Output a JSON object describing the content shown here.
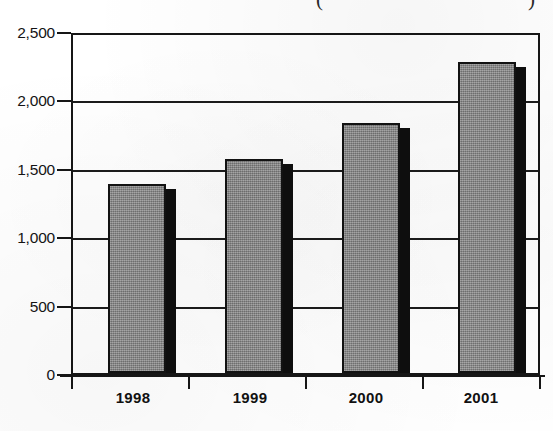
{
  "chart_data": {
    "type": "bar",
    "title": "",
    "title_fragment_left": "(",
    "title_fragment_right": ")",
    "xlabel": "",
    "ylabel": "",
    "categories": [
      "1998",
      "1999",
      "2000",
      "2001"
    ],
    "values": [
      1400,
      1580,
      1850,
      2300
    ],
    "series": [
      {
        "name": "",
        "values": [
          1400,
          1580,
          1850,
          2300
        ]
      }
    ],
    "ylim": [
      0,
      2500
    ],
    "y_ticks": [
      0,
      500,
      1000,
      1500,
      2000,
      2500
    ],
    "y_tick_labels": [
      "0",
      "500",
      "1,000",
      "1,500",
      "2,000",
      "2,500"
    ],
    "grid": true,
    "grid_axis": "y",
    "legend": false,
    "legend_position": "none",
    "bar_style": "3d-shadow",
    "colors": {
      "bar_face": "#8a8a8a",
      "bar_outline": "#121212",
      "bar_side": "#0e0e0e",
      "axis": "#161616",
      "grid": "#1b1b1b",
      "text": "#111111",
      "background": "#ffffff"
    }
  },
  "axes": {
    "y_tick_labels": [
      "2,500",
      "2,000",
      "1,500",
      "1,000",
      "500",
      "0"
    ],
    "x_tick_labels": [
      "1998",
      "1999",
      "2000",
      "2001"
    ]
  }
}
